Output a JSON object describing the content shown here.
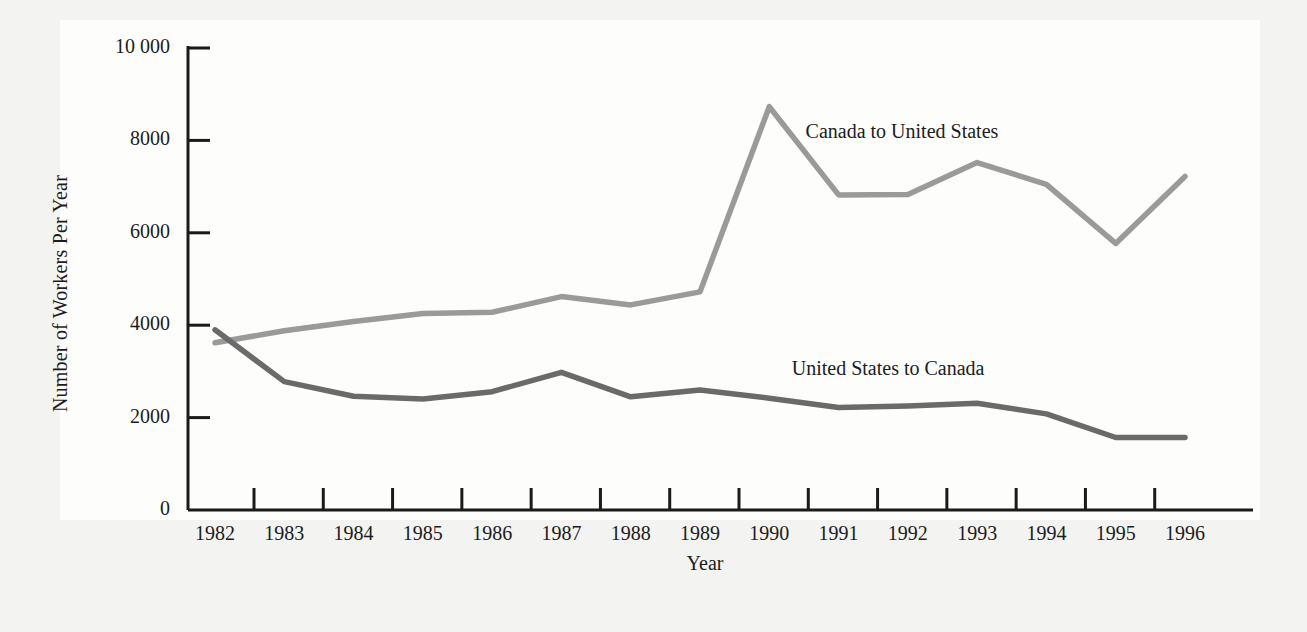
{
  "chart_data": {
    "type": "line",
    "title": "",
    "subtitle": "",
    "xlabel": "Year",
    "ylabel": "Number of Workers Per Year",
    "categories": [
      1982,
      1983,
      1984,
      1985,
      1986,
      1987,
      1988,
      1989,
      1990,
      1991,
      1992,
      1993,
      1994,
      1995,
      1996
    ],
    "x_tick_labels": [
      "1982",
      "1983",
      "1984",
      "1985",
      "1986",
      "1987",
      "1988",
      "1989",
      "1990",
      "1991",
      "1992",
      "1993",
      "1994",
      "1995",
      "1996"
    ],
    "y_tick_labels": [
      "0",
      "2000",
      "4000",
      "6000",
      "8000",
      "10 000"
    ],
    "y_tick_values": [
      0,
      2000,
      4000,
      6000,
      8000,
      10000
    ],
    "ylim": [
      0,
      10000
    ],
    "xlim": [
      1982,
      1996
    ],
    "grid": false,
    "legend_position": "inline-annotation",
    "series": [
      {
        "name": "Canada to United States",
        "color": "#9a9a9a",
        "label_x": 1992.4,
        "label_y": 8150,
        "values": [
          3620,
          3880,
          4080,
          4250,
          4280,
          4620,
          4440,
          4720,
          8730,
          6820,
          6830,
          7520,
          7050,
          5770,
          7220
        ]
      },
      {
        "name": "United States to Canada",
        "color": "#6a6a6a",
        "label_x": 1992.2,
        "label_y": 3040,
        "values": [
          3900,
          2780,
          2460,
          2400,
          2560,
          2980,
          2450,
          2600,
          2420,
          2220,
          2250,
          2310,
          2080,
          1570,
          1570
        ]
      }
    ]
  },
  "axes": {
    "y_axis_name": "vertical-axis",
    "x_axis_name": "horizontal-axis"
  }
}
